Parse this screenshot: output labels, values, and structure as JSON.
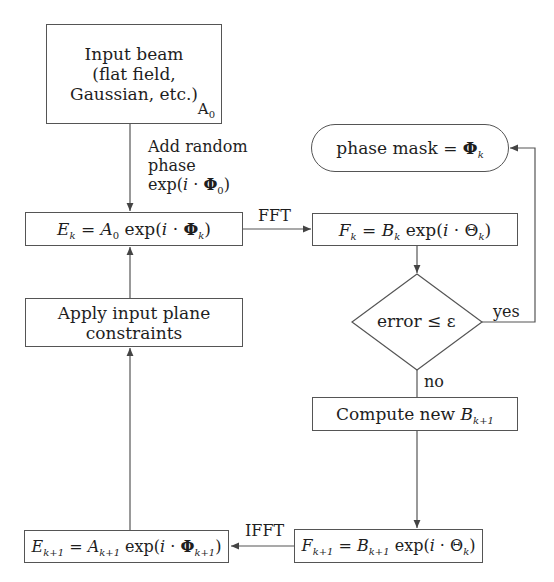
{
  "diagram": {
    "type": "flowchart",
    "nodes": {
      "input_beam": {
        "line1": "Input beam",
        "line2": "(flat field,",
        "line3": "Gaussian, etc.)",
        "corner_label": "A",
        "corner_sub": "0"
      },
      "ek": {
        "lhs": "E",
        "lhs_sub": "k",
        "eq": " = ",
        "a": "A",
        "a_sub": "0",
        "exp": " exp(",
        "i": "i",
        "dot": " · ",
        "phi": "Φ",
        "phi_sub": "k",
        "close": ")"
      },
      "fk": {
        "lhs": "F",
        "lhs_sub": "k",
        "eq": " = ",
        "b": "B",
        "b_sub": "k",
        "exp": " exp(",
        "i": "i",
        "dot": " · ",
        "theta": "Θ",
        "theta_sub": "k",
        "close": ")"
      },
      "phase_mask": {
        "text": "phase mask = ",
        "phi": "Φ",
        "phi_sub": "k"
      },
      "apply_constraints": {
        "line1": "Apply input plane",
        "line2": "constraints"
      },
      "decision": {
        "text": "error ≤ ε"
      },
      "compute_b": {
        "text": "Compute new ",
        "b": "B",
        "b_sub": "k+1"
      },
      "ek1": {
        "lhs": "E",
        "lhs_sub": "k+1",
        "eq": " = ",
        "a": "A",
        "a_sub": "k+1",
        "exp": " exp(",
        "i": "i",
        "dot": " · ",
        "phi": "Φ",
        "phi_sub": "k+1",
        "close": ")"
      },
      "fk1": {
        "lhs": "F",
        "lhs_sub": "k+1",
        "eq": " = ",
        "b": "B",
        "b_sub": "k+1",
        "exp": " exp(",
        "i": "i",
        "dot": " · ",
        "theta": "Θ",
        "theta_sub": "k",
        "close": ")"
      }
    },
    "edge_labels": {
      "add_phase_1": "Add random",
      "add_phase_2": "phase",
      "add_phase_3_pre": "exp(",
      "add_phase_3_i": "i",
      "add_phase_3_dot": " · ",
      "add_phase_3_phi": "Φ",
      "add_phase_3_sub": "0",
      "add_phase_3_close": ")",
      "fft": "FFT",
      "ifft": "IFFT",
      "yes": "yes",
      "no": "no"
    },
    "colors": {
      "line": "#555555",
      "text": "#1e1e1e",
      "background": "#ffffff"
    }
  }
}
